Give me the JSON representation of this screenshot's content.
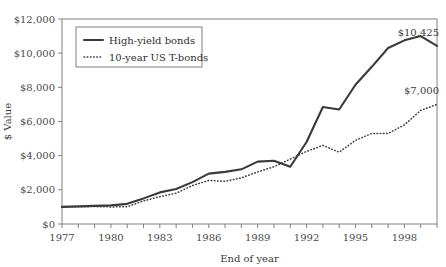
{
  "chart_data": {
    "type": "line",
    "title": "",
    "xlabel": "End of year",
    "ylabel": "$ Value",
    "ylim": [
      0,
      12000
    ],
    "xlim": [
      1977,
      2000
    ],
    "grid": false,
    "legend_position": "top-left",
    "ytick_labels": [
      "$12,000",
      "$10,000",
      "$8,000",
      "$6,000",
      "$4,000",
      "$2,000",
      "$0"
    ],
    "ytick_values": [
      12000,
      10000,
      8000,
      6000,
      4000,
      2000,
      0
    ],
    "xtick_labels": [
      "1977",
      "1980",
      "1983",
      "1986",
      "1989",
      "1992",
      "1995",
      "1998"
    ],
    "xtick_values": [
      1977,
      1980,
      1983,
      1986,
      1989,
      1992,
      1995,
      1998
    ],
    "x": [
      1977,
      1978,
      1979,
      1980,
      1981,
      1982,
      1983,
      1984,
      1985,
      1986,
      1987,
      1988,
      1989,
      1990,
      1991,
      1992,
      1993,
      1994,
      1995,
      1996,
      1997,
      1998,
      1999,
      2000
    ],
    "series": [
      {
        "name": "High-yield bonds",
        "style": "solid",
        "color": "#3a3a3a",
        "values": [
          1000,
          1030,
          1060,
          1090,
          1180,
          1500,
          1850,
          2050,
          2450,
          2950,
          3050,
          3200,
          3650,
          3700,
          3350,
          4800,
          6850,
          6700,
          8150,
          9200,
          10300,
          10750,
          11000,
          10425
        ]
      },
      {
        "name": "10-year US T-bonds",
        "style": "dotted",
        "color": "#3a3a3a",
        "values": [
          1000,
          1010,
          1020,
          1000,
          1010,
          1350,
          1600,
          1800,
          2250,
          2550,
          2500,
          2700,
          3050,
          3350,
          3800,
          4250,
          4600,
          4200,
          4900,
          5300,
          5300,
          5800,
          6650,
          7000
        ]
      }
    ],
    "annotations": [
      {
        "text": "$10,425",
        "series": "High-yield bonds",
        "x": 2000,
        "y": 10425
      },
      {
        "text": "$7,000",
        "series": "10-year US T-bonds",
        "x": 2000,
        "y": 7000
      }
    ]
  }
}
